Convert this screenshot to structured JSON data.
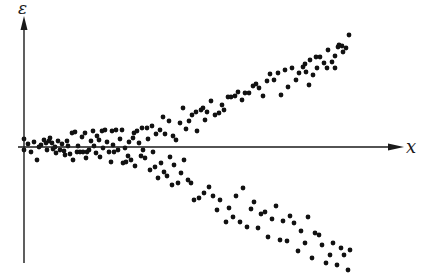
{
  "chart_data": {
    "type": "scatter",
    "title": "",
    "xlabel": "x",
    "ylabel": "ε",
    "grid": false,
    "legend": null,
    "axes": {
      "origin_px": [
        24,
        147
      ],
      "x_axis_end_px": 404,
      "y_axis_top_px": 18,
      "y_axis_bottom_px": 263
    },
    "series": [
      {
        "name": "residuals",
        "points_px": [
          [
            24,
            139
          ],
          [
            24,
            150
          ],
          [
            28,
            144
          ],
          [
            31,
            152
          ],
          [
            34,
            142
          ],
          [
            37,
            160
          ],
          [
            39,
            147
          ],
          [
            41,
            145
          ],
          [
            44,
            140
          ],
          [
            46,
            143
          ],
          [
            47,
            150
          ],
          [
            49,
            141
          ],
          [
            50,
            138
          ],
          [
            52,
            143
          ],
          [
            53,
            149
          ],
          [
            55,
            147
          ],
          [
            56,
            153
          ],
          [
            58,
            141
          ],
          [
            60,
            150
          ],
          [
            62,
            144
          ],
          [
            64,
            151
          ],
          [
            65,
            155
          ],
          [
            67,
            141
          ],
          [
            68,
            146
          ],
          [
            70,
            154
          ],
          [
            72,
            133
          ],
          [
            73,
            160
          ],
          [
            75,
            132
          ],
          [
            77,
            152
          ],
          [
            78,
            146
          ],
          [
            80,
            152
          ],
          [
            82,
            137
          ],
          [
            83,
            152
          ],
          [
            85,
            133
          ],
          [
            86,
            158
          ],
          [
            87,
            152
          ],
          [
            89,
            150
          ],
          [
            91,
            141
          ],
          [
            93,
            131
          ],
          [
            94,
            146
          ],
          [
            96,
            153
          ],
          [
            97,
            136
          ],
          [
            99,
            140
          ],
          [
            100,
            157
          ],
          [
            102,
            131
          ],
          [
            103,
            148
          ],
          [
            105,
            130
          ],
          [
            107,
            142
          ],
          [
            109,
            152
          ],
          [
            111,
            162
          ],
          [
            112,
            131
          ],
          [
            113,
            145
          ],
          [
            114,
            152
          ],
          [
            116,
            130
          ],
          [
            118,
            150
          ],
          [
            120,
            139
          ],
          [
            122,
            130
          ],
          [
            123,
            163
          ],
          [
            125,
            148
          ],
          [
            126,
            162
          ],
          [
            128,
            156
          ],
          [
            129,
            142
          ],
          [
            131,
            160
          ],
          [
            133,
            138
          ],
          [
            134,
            133
          ],
          [
            135,
            166
          ],
          [
            137,
            131
          ],
          [
            139,
            143
          ],
          [
            141,
            156
          ],
          [
            142,
            128
          ],
          [
            143,
            150
          ],
          [
            145,
            158
          ],
          [
            147,
            128
          ],
          [
            148,
            139
          ],
          [
            150,
            170
          ],
          [
            152,
            126
          ],
          [
            153,
            152
          ],
          [
            155,
            167
          ],
          [
            156,
            134
          ],
          [
            158,
            178
          ],
          [
            160,
            130
          ],
          [
            161,
            163
          ],
          [
            163,
            117
          ],
          [
            164,
            172
          ],
          [
            165,
            134
          ],
          [
            167,
            176
          ],
          [
            169,
            121
          ],
          [
            170,
            157
          ],
          [
            172,
            185
          ],
          [
            173,
            136
          ],
          [
            174,
            165
          ],
          [
            176,
            140
          ],
          [
            178,
            183
          ],
          [
            180,
            123
          ],
          [
            181,
            173
          ],
          [
            183,
            108
          ],
          [
            184,
            160
          ],
          [
            186,
            129
          ],
          [
            188,
            180
          ],
          [
            189,
            121
          ],
          [
            191,
            183
          ],
          [
            192,
            115
          ],
          [
            194,
            200
          ],
          [
            196,
            112
          ],
          [
            197,
            131
          ],
          [
            199,
            198
          ],
          [
            201,
            110
          ],
          [
            203,
            108
          ],
          [
            204,
            193
          ],
          [
            205,
            120
          ],
          [
            207,
            112
          ],
          [
            209,
            187
          ],
          [
            211,
            101
          ],
          [
            213,
            196
          ],
          [
            215,
            115
          ],
          [
            217,
            210
          ],
          [
            219,
            113
          ],
          [
            220,
            200
          ],
          [
            222,
            105
          ],
          [
            224,
            110
          ],
          [
            226,
            222
          ],
          [
            228,
            97
          ],
          [
            229,
            208
          ],
          [
            231,
            97
          ],
          [
            233,
            217
          ],
          [
            235,
            96
          ],
          [
            236,
            196
          ],
          [
            238,
            92
          ],
          [
            240,
            222
          ],
          [
            242,
            100
          ],
          [
            243,
            188
          ],
          [
            245,
            93
          ],
          [
            247,
            227
          ],
          [
            249,
            93
          ],
          [
            251,
            209
          ],
          [
            253,
            86
          ],
          [
            254,
            202
          ],
          [
            256,
            84
          ],
          [
            258,
            228
          ],
          [
            259,
            88
          ],
          [
            261,
            214
          ],
          [
            263,
            96
          ],
          [
            265,
            212
          ],
          [
            267,
            81
          ],
          [
            268,
            237
          ],
          [
            270,
            74
          ],
          [
            272,
            219
          ],
          [
            274,
            80
          ],
          [
            276,
            206
          ],
          [
            278,
            73
          ],
          [
            280,
            240
          ],
          [
            281,
            95
          ],
          [
            283,
            221
          ],
          [
            285,
            70
          ],
          [
            287,
            241
          ],
          [
            288,
            87
          ],
          [
            290,
            216
          ],
          [
            292,
            68
          ],
          [
            294,
            223
          ],
          [
            296,
            80
          ],
          [
            298,
            251
          ],
          [
            299,
            73
          ],
          [
            301,
            231
          ],
          [
            303,
            67
          ],
          [
            305,
            243
          ],
          [
            306,
            72
          ],
          [
            308,
            217
          ],
          [
            310,
            60
          ],
          [
            312,
            258
          ],
          [
            313,
            75
          ],
          [
            315,
            233
          ],
          [
            317,
            68
          ],
          [
            319,
            235
          ],
          [
            320,
            57
          ],
          [
            322,
            245
          ],
          [
            324,
            63
          ],
          [
            326,
            263
          ],
          [
            328,
            50
          ],
          [
            330,
            255
          ],
          [
            332,
            62
          ],
          [
            333,
            243
          ],
          [
            335,
            56
          ],
          [
            337,
            265
          ],
          [
            339,
            45
          ],
          [
            341,
            248
          ],
          [
            343,
            52
          ],
          [
            344,
            255
          ],
          [
            346,
            48
          ],
          [
            348,
            270
          ],
          [
            349,
            35
          ],
          [
            350,
            250
          ],
          [
            305,
            64
          ],
          [
            309,
            85
          ],
          [
            316,
            57
          ],
          [
            335,
            68
          ],
          [
            338,
            47
          ],
          [
            327,
            68
          ],
          [
            342,
            46
          ]
        ]
      }
    ]
  }
}
